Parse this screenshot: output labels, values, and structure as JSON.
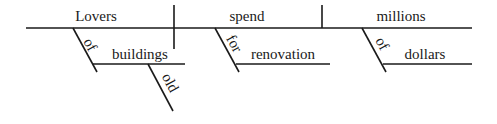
{
  "diagram": {
    "type": "sentence-diagram",
    "sentence": "Lovers of old buildings spend millions of dollars for renovation",
    "colors": {
      "ink": "#1a1a1a",
      "background": "#ffffff"
    },
    "baseline": {
      "subject": "Lovers",
      "verb": "spend",
      "object": "millions"
    },
    "modifiers": [
      {
        "preposition": "of",
        "object": "buildings",
        "modifies": "Lovers",
        "adjective": "old"
      },
      {
        "preposition": "for",
        "object": "renovation",
        "modifies": "spend"
      },
      {
        "preposition": "of",
        "object": "dollars",
        "modifies": "millions"
      }
    ]
  }
}
